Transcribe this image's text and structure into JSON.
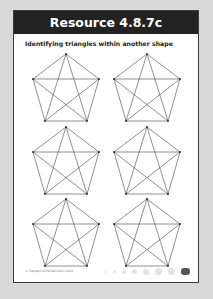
{
  "header": {
    "title": "Resource 4.8.7c",
    "background": "#222222"
  },
  "subtitle": "Identifying triangles within another shape",
  "pentagons": [
    {
      "row": 1,
      "col": 1
    },
    {
      "row": 1,
      "col": 2
    },
    {
      "row": 2,
      "col": 1
    },
    {
      "row": 2,
      "col": 2
    },
    {
      "row": 3,
      "col": 1
    },
    {
      "row": 3,
      "col": 2
    }
  ],
  "footer": {
    "copyright": "© HarperCollinsPublishers 2018",
    "page_number": ""
  }
}
